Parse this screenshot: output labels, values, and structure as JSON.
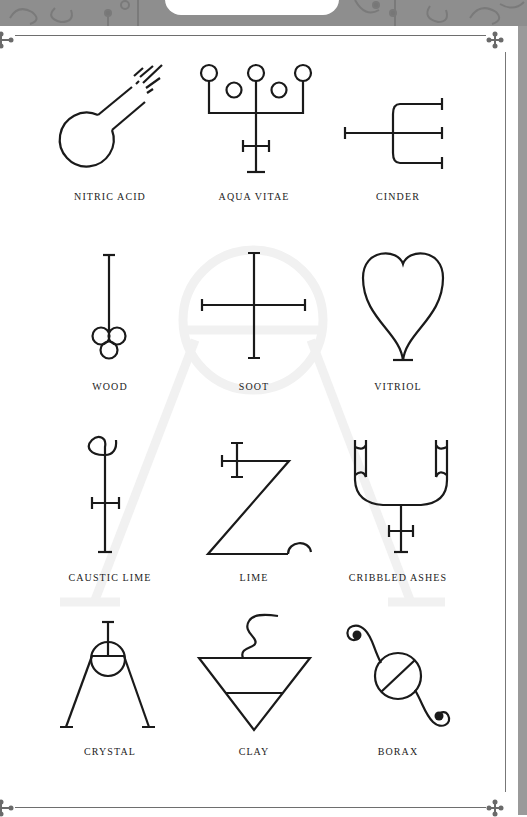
{
  "page": {
    "header_tab_text": "ALCHEMICAL SYMBOLS",
    "colors": {
      "header_band": "#8e8e8e",
      "frame_line": "#6e6e6e",
      "ink": "#1a1a1a",
      "label_text": "#222222",
      "watermark": "#f2f2f2"
    }
  },
  "symbols": [
    {
      "label": "NITRIC ACID",
      "icon": "nitric-acid-symbol"
    },
    {
      "label": "AQUA VITAE",
      "icon": "aqua-vitae-symbol"
    },
    {
      "label": "CINDER",
      "icon": "cinder-symbol"
    },
    {
      "label": "WOOD",
      "icon": "wood-symbol"
    },
    {
      "label": "SOOT",
      "icon": "soot-symbol"
    },
    {
      "label": "VITRIOL",
      "icon": "vitriol-symbol"
    },
    {
      "label": "CAUSTIC LIME",
      "icon": "caustic-lime-symbol"
    },
    {
      "label": "LIME",
      "icon": "lime-symbol"
    },
    {
      "label": "CRIBBLED ASHES",
      "icon": "cribbled-ashes-symbol"
    },
    {
      "label": "CRYSTAL",
      "icon": "crystal-symbol"
    },
    {
      "label": "CLAY",
      "icon": "clay-symbol"
    },
    {
      "label": "BORAX",
      "icon": "borax-symbol"
    }
  ]
}
